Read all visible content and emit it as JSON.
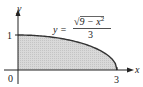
{
  "chart_data": {
    "type": "area",
    "title": "",
    "equation": {
      "lhs": "y =",
      "numerator": "√9 − x²",
      "numerator_radicand": "9 − x",
      "numerator_exponent": "2",
      "denominator": "3"
    },
    "xlabel": "x",
    "ylabel": "y",
    "x_ticks": [
      "0",
      "3"
    ],
    "y_ticks": [
      "1"
    ],
    "xlim": [
      0,
      3
    ],
    "ylim": [
      0,
      1
    ],
    "x": [
      0,
      0.5,
      1,
      1.5,
      2,
      2.5,
      2.8,
      2.95,
      3
    ],
    "values": [
      1,
      0.986,
      0.943,
      0.866,
      0.745,
      0.553,
      0.359,
      0.182,
      0
    ],
    "fill_color": "#d6d6d6",
    "curve_color": "#333333",
    "axis_color": "#222222",
    "grid": false,
    "legend": null
  }
}
